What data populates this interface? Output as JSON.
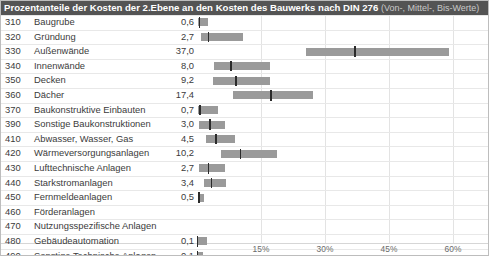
{
  "title": {
    "main": "Prozentanteile der Kosten der 2.Ebene an den Kosten des Bauwerks nach DIN 276",
    "sub": "(Von-, Mittel-, Bis-Werte)"
  },
  "colors": {
    "title_bar": "#545454",
    "title_text": "#ffffff",
    "title_sub_text": "#c9c9c9",
    "bar": "#9a9a9a",
    "marker": "#2b2b2b",
    "grid": "#e3e3e3",
    "text": "#3b3b3b",
    "axis_text": "#6b6b6b",
    "background": "#ffffff"
  },
  "chart_data": {
    "type": "bar",
    "title": "Prozentanteile der Kosten der 2.Ebene an den Kosten des Bauwerks nach DIN 276 (Von-, Mittel-, Bis-Werte)",
    "xlabel": "",
    "ylabel": "",
    "xlim": [
      0,
      65
    ],
    "grid": true,
    "legend": "none",
    "xticks": [
      "15%",
      "30%",
      "45%",
      "60%"
    ],
    "xtick_values": [
      15,
      30,
      45,
      60
    ],
    "value_unit": "%",
    "value_labels_are": "Mittelwert",
    "categories": [
      {
        "code": "310",
        "label": "Baugrube",
        "value": "0,6",
        "mean": 0.6,
        "low": 0.3,
        "high": 2.5
      },
      {
        "code": "320",
        "label": "Gründung",
        "value": "2,7",
        "mean": 2.7,
        "low": 1.0,
        "high": 10.8
      },
      {
        "code": "330",
        "label": "Außenwände",
        "value": "37,0",
        "mean": 37.0,
        "low": 25.5,
        "high": 59.1
      },
      {
        "code": "340",
        "label": "Innenwände",
        "value": "8,0",
        "mean": 8.0,
        "low": 4.0,
        "high": 17.0
      },
      {
        "code": "350",
        "label": "Decken",
        "value": "9,2",
        "mean": 9.2,
        "low": 3.8,
        "high": 17.1
      },
      {
        "code": "360",
        "label": "Dächer",
        "value": "17,4",
        "mean": 17.4,
        "low": 8.5,
        "high": 27.2
      },
      {
        "code": "370",
        "label": "Baukonstruktive Einbauten",
        "value": "0,7",
        "mean": 0.7,
        "low": 0.2,
        "high": 4.9
      },
      {
        "code": "390",
        "label": "Sonstige Baukonstruktionen",
        "value": "3,0",
        "mean": 3.0,
        "low": 0.5,
        "high": 6.6
      },
      {
        "code": "410",
        "label": "Abwasser, Wasser, Gas",
        "value": "4,5",
        "mean": 4.5,
        "low": 2.1,
        "high": 8.9
      },
      {
        "code": "420",
        "label": "Wärmeversorgungsanlagen",
        "value": "10,2",
        "mean": 10.2,
        "low": 5.6,
        "high": 18.8
      },
      {
        "code": "430",
        "label": "Lufttechnische Anlagen",
        "value": "2,7",
        "mean": 2.7,
        "low": 0.4,
        "high": 6.6
      },
      {
        "code": "440",
        "label": "Starkstromanlagen",
        "value": "3,4",
        "mean": 3.4,
        "low": 1.6,
        "high": 6.8
      },
      {
        "code": "450",
        "label": "Fernmeldeanlagen",
        "value": "0,5",
        "mean": 0.5,
        "low": 0.2,
        "high": 1.6
      },
      {
        "code": "460",
        "label": "Förderanlagen",
        "value": "",
        "mean": null,
        "low": null,
        "high": null
      },
      {
        "code": "470",
        "label": "Nutzungsspezifische Anlagen",
        "value": "",
        "mean": null,
        "low": null,
        "high": null
      },
      {
        "code": "480",
        "label": "Gebäudeautomation",
        "value": "0,1",
        "mean": 0.1,
        "low": 0.1,
        "high": 2.3
      },
      {
        "code": "490",
        "label": "Sonstige Technische Anlagen",
        "value": "0,1",
        "mean": 0.1,
        "low": 0.1,
        "high": 1.3
      }
    ]
  }
}
